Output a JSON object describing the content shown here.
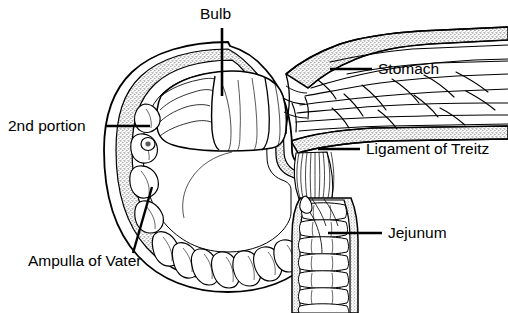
{
  "figure": {
    "type": "anatomical-line-diagram",
    "style": "black-and-white pen-and-ink cross-section",
    "background_color": "#ffffff",
    "line_color": "#000000",
    "stipple_color": "#8a8a8a"
  },
  "labels": [
    {
      "id": "bulb",
      "text": "Bulb",
      "icon": "text-label",
      "text_x": 200,
      "text_y": 6,
      "leader": {
        "type": "vertical",
        "x1": 222,
        "y1": 28,
        "x2": 222,
        "y2": 96
      }
    },
    {
      "id": "stomach",
      "text": "Stomach",
      "icon": "text-label",
      "text_x": 378,
      "text_y": 61,
      "leader": {
        "type": "horizontal",
        "x1": 330,
        "y1": 69,
        "x2": 372,
        "y2": 69
      }
    },
    {
      "id": "second-portion",
      "text": "2nd portion",
      "icon": "text-label",
      "text_x": 8,
      "text_y": 118,
      "leader": {
        "type": "horizontal",
        "x1": 106,
        "y1": 126,
        "x2": 150,
        "y2": 126
      }
    },
    {
      "id": "ligament-of-treitz",
      "text": "Ligament of Treitz",
      "icon": "text-label",
      "text_x": 366,
      "text_y": 141,
      "leader": {
        "type": "horizontal",
        "x1": 318,
        "y1": 149,
        "x2": 360,
        "y2": 149
      }
    },
    {
      "id": "jejunum",
      "text": "Jejunum",
      "icon": "text-label",
      "text_x": 388,
      "text_y": 225,
      "leader": {
        "type": "horizontal",
        "x1": 328,
        "y1": 233,
        "x2": 382,
        "y2": 233
      }
    },
    {
      "id": "ampulla-of-vater",
      "text": "Ampulla of Vater",
      "icon": "text-label",
      "text_x": 28,
      "text_y": 253,
      "leader": {
        "type": "diagonal",
        "x1": 152,
        "y1": 187,
        "x2": 133,
        "y2": 253
      }
    }
  ],
  "structures": [
    {
      "id": "duodenal-bulb",
      "name": "Duodenal bulb lumen"
    },
    {
      "id": "duodenum-c-loop",
      "name": "Duodenal C-loop wall"
    },
    {
      "id": "stomach-antrum",
      "name": "Stomach antrum with rugal folds"
    },
    {
      "id": "pyloric-channel",
      "name": "Pyloric channel"
    },
    {
      "id": "duodenal-papilla",
      "name": "Ampulla of Vater papilla"
    },
    {
      "id": "treitz-ligament",
      "name": "Suspensory ligament fibers"
    },
    {
      "id": "jejunal-loop",
      "name": "Jejunum with valvulae conniventes"
    }
  ]
}
